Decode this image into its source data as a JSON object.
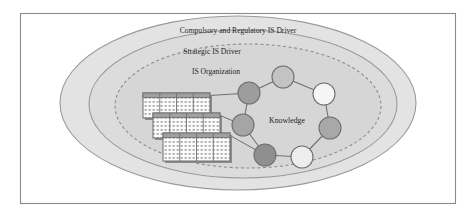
{
  "figure": {
    "type": "nested-ellipse-venn-diagram",
    "frame": {
      "stroke": "#8a8a8a",
      "fill": "#ffffff"
    },
    "layers": [
      {
        "id": "compulsory-regulatory-is-driver",
        "label": "Compulsory and Regulatory IS Driver",
        "border_style": "solid",
        "fill": "#e3e3e3",
        "stroke": "#9a9a9a",
        "cx": 238,
        "cy": 103,
        "rx": 178,
        "ry": 87,
        "label_x": 238,
        "label_y": 33
      },
      {
        "id": "strategic-is-driver",
        "label": "Strategic IS Driver",
        "border_style": "solid",
        "fill": "#dcdcdc",
        "stroke": "#9a9a9a",
        "cx": 243,
        "cy": 104,
        "rx": 154,
        "ry": 74,
        "label_x": 212,
        "label_y": 54
      },
      {
        "id": "is-organization",
        "label": "IS Organization",
        "border_style": "dashed",
        "fill": "#d6d6d6",
        "stroke": "#8d8d8d",
        "cx": 248,
        "cy": 106,
        "rx": 133,
        "ry": 62,
        "label_x": 216,
        "label_y": 74
      }
    ],
    "knowledge_network": {
      "label": "Knowledge",
      "label_x": 287,
      "label_y": 123,
      "center_x": 288,
      "center_y": 122,
      "radius": 47,
      "node_radius": 11,
      "link_stroke": "#6f6f6f",
      "node_stroke": "#6f6f6f",
      "nodes": [
        {
          "id": "node-top",
          "cx": 283,
          "cy": 77,
          "fill": "#c3c3c3"
        },
        {
          "id": "node-top-right",
          "cx": 324,
          "cy": 94,
          "fill": "#f5f5f5"
        },
        {
          "id": "node-right",
          "cx": 330,
          "cy": 128,
          "fill": "#a8a8a8"
        },
        {
          "id": "node-bottom-right",
          "cx": 302,
          "cy": 157,
          "fill": "#ededed"
        },
        {
          "id": "node-bottom-left",
          "cx": 265,
          "cy": 155,
          "fill": "#8f8f8f"
        },
        {
          "id": "node-left",
          "cx": 243,
          "cy": 125,
          "fill": "#a5a5a5"
        },
        {
          "id": "node-top-left",
          "cx": 249,
          "cy": 93,
          "fill": "#9d9d9d"
        }
      ],
      "links": [
        [
          "node-top",
          "node-top-right"
        ],
        [
          "node-top-right",
          "node-right"
        ],
        [
          "node-right",
          "node-bottom-right"
        ],
        [
          "node-bottom-right",
          "node-bottom-left"
        ],
        [
          "node-bottom-left",
          "node-left"
        ],
        [
          "node-left",
          "node-top-left"
        ],
        [
          "node-top-left",
          "node-top"
        ]
      ]
    },
    "data_tables": {
      "count": 3,
      "columns": 4,
      "rows": 3,
      "header_fill": "#a0a0a0",
      "cell_fill": "#fbfbfb",
      "stroke": "#6f6f6f",
      "shadow": "#8c8c8c",
      "items": [
        {
          "id": "table-back",
          "x": 143,
          "y": 93,
          "w": 67,
          "h": 25
        },
        {
          "id": "table-middle",
          "x": 153,
          "y": 113,
          "w": 67,
          "h": 25
        },
        {
          "id": "table-front",
          "x": 163,
          "y": 133,
          "w": 67,
          "h": 28
        }
      ],
      "connectors": [
        {
          "from": "table-back",
          "to": "node-top-left"
        },
        {
          "from": "table-middle",
          "to": "node-left"
        },
        {
          "from": "table-front",
          "to": "node-bottom-left"
        }
      ]
    }
  }
}
